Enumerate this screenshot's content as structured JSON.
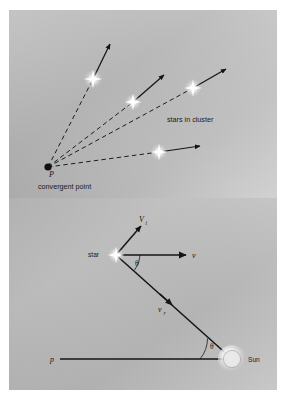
{
  "figure": {
    "background_color": "#ffffff",
    "panel_color": "#b9b9b9",
    "ink_color": "#1a1a1a"
  },
  "panel_top": {
    "name": "convergent-point-panel",
    "labels": {
      "stars_in_cluster": "stars in cluster",
      "convergent_point": "convergent point",
      "convergent_point_symbol": "P"
    },
    "convergent_point": {
      "x": 48,
      "y": 167
    },
    "stars": [
      {
        "id": "star-1",
        "x": 93,
        "y": 79,
        "arrow_tip_x": 111,
        "arrow_tip_y": 42
      },
      {
        "id": "star-2",
        "x": 133,
        "y": 102,
        "arrow_tip_x": 166,
        "arrow_tip_y": 73
      },
      {
        "id": "star-3",
        "x": 193,
        "y": 88,
        "arrow_tip_x": 228,
        "arrow_tip_y": 67
      },
      {
        "id": "star-4",
        "x": 159,
        "y": 152,
        "arrow_tip_x": 203,
        "arrow_tip_y": 146
      }
    ]
  },
  "panel_bottom": {
    "name": "velocity-components-panel",
    "labels": {
      "star": "star",
      "sun": "Sun",
      "tangential_velocity": "V",
      "tangential_velocity_sub": "t",
      "total_velocity": "v",
      "radial_velocity": "v",
      "radial_velocity_sub": "r",
      "parallax_baseline": "p",
      "angle_at_star": "θ",
      "angle_at_sun": "θ"
    },
    "points": {
      "star": {
        "x": 116,
        "y": 255
      },
      "sun": {
        "x": 232,
        "y": 359
      },
      "baseline_left": {
        "x": 60,
        "y": 359
      },
      "v_arrow_tip": {
        "x": 189,
        "y": 255
      },
      "vt_arrow_tip": {
        "x": 143,
        "y": 224
      }
    }
  }
}
